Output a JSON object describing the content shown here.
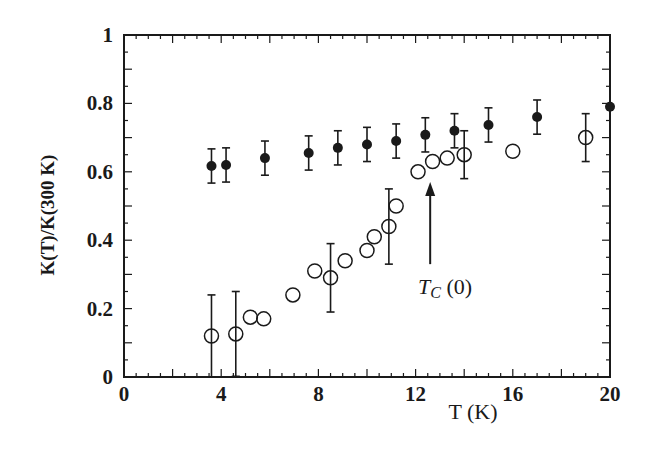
{
  "chart_data": {
    "type": "scatter",
    "title": "",
    "xlabel": "T (K)",
    "ylabel": "K(T)/K(300 K)",
    "xlim": [
      0,
      20
    ],
    "ylim": [
      0,
      1
    ],
    "xticks": [
      0,
      4,
      8,
      12,
      16,
      20
    ],
    "xtick_labels": [
      "0",
      "4",
      "8",
      "12",
      "16",
      "20"
    ],
    "yticks": [
      0,
      0.2,
      0.4,
      0.6,
      0.8,
      1
    ],
    "ytick_labels": [
      "0",
      "0.2",
      "0.4",
      "0.6",
      "0.8",
      "1"
    ],
    "grid": false,
    "legend": null,
    "series": [
      {
        "name": "filled circles",
        "marker": "filled-circle",
        "color": "#1a1a1a",
        "x": [
          3.6,
          4.2,
          5.8,
          7.6,
          8.8,
          10.0,
          11.2,
          12.4,
          13.6,
          15.0,
          17.0,
          20.0
        ],
        "y": [
          0.617,
          0.62,
          0.64,
          0.655,
          0.67,
          0.68,
          0.69,
          0.708,
          0.72,
          0.737,
          0.76,
          0.79
        ],
        "yerr": [
          0.05,
          0.05,
          0.05,
          0.05,
          0.05,
          0.05,
          0.05,
          0.05,
          0.05,
          0.05,
          0.05,
          0
        ]
      },
      {
        "name": "open circles",
        "marker": "open-circle",
        "color": "#1a1a1a",
        "x": [
          3.6,
          4.6,
          5.2,
          5.75,
          6.95,
          7.85,
          8.5,
          9.1,
          10.0,
          10.3,
          10.9,
          11.2,
          12.1,
          12.7,
          13.3,
          14.0,
          16.0,
          19.0
        ],
        "y": [
          0.12,
          0.126,
          0.175,
          0.17,
          0.24,
          0.31,
          0.29,
          0.34,
          0.37,
          0.41,
          0.44,
          0.5,
          0.6,
          0.63,
          0.64,
          0.65,
          0.66,
          0.7
        ],
        "yerr": [
          0.12,
          0.124,
          0,
          0,
          0,
          0,
          0.1,
          0,
          0,
          0,
          0.11,
          0,
          0,
          0,
          0,
          0.07,
          0,
          0.07
        ]
      }
    ],
    "annotations": [
      {
        "text_main": "T",
        "text_sub": "C",
        "text_tail": " (0)",
        "arrow_x": 12.6,
        "arrow_from_y": 0.33,
        "arrow_to_y": 0.57
      }
    ]
  }
}
